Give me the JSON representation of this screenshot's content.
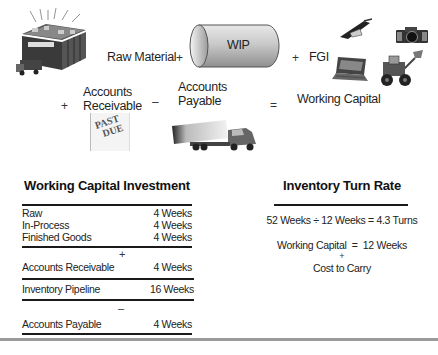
{
  "equation": {
    "raw_material": "Raw Material",
    "plus1": "+",
    "wip": "WIP",
    "plus2": "+",
    "fgi": "FGI",
    "plus3": "+",
    "accounts_receivable_line1": "Accounts",
    "accounts_receivable_line2": "Receivable",
    "minus": "–",
    "accounts_payable_line1": "Accounts",
    "accounts_payable_line2": "Payable",
    "equals": "=",
    "working_capital": "Working Capital",
    "past_due_stamp_line1": "PAST",
    "past_due_stamp_line2": "DUE",
    "warehouse_sign": "WAREHOUSE"
  },
  "investment": {
    "title": "Working Capital Investment",
    "inventory_rows": [
      {
        "label": "Raw",
        "value": "4 Weeks"
      },
      {
        "label": "In-Process",
        "value": "4 Weeks"
      },
      {
        "label": "Finished Goods",
        "value": "4 Weeks"
      }
    ],
    "plus": "+",
    "receivable": {
      "label": "Accounts Receivable",
      "value": "4 Weeks"
    },
    "pipeline": {
      "label": "Inventory Pipeline",
      "value": "16 Weeks"
    },
    "minus": "–",
    "payable": {
      "label": "Accounts Payable",
      "value": "4 Weeks"
    }
  },
  "turn_rate": {
    "title": "Inventory Turn Rate",
    "formula": "52 Weeks ÷ 12 Weeks = 4.3 Turns",
    "wc_line": "Working Capital  =  12 Weeks",
    "plus": "+",
    "cost_line": "Cost to Carry"
  }
}
